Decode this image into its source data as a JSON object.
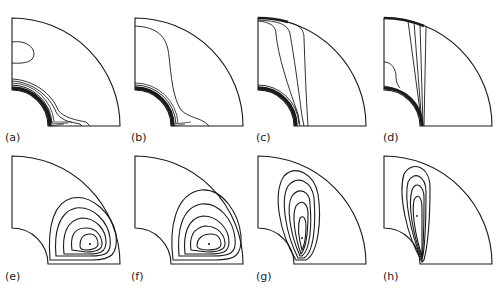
{
  "figure": {
    "panels": [
      {
        "id": "a",
        "label": "(a)"
      },
      {
        "id": "b",
        "label": "(b)"
      },
      {
        "id": "c",
        "label": "(c)"
      },
      {
        "id": "d",
        "label": "(d)"
      },
      {
        "id": "e",
        "label": "(e)"
      },
      {
        "id": "f",
        "label": "(f)"
      },
      {
        "id": "g",
        "label": "(g)"
      },
      {
        "id": "h",
        "label": "(h)"
      }
    ],
    "colors": {
      "stroke": "#1a1a1a",
      "background": "#ffffff"
    }
  }
}
